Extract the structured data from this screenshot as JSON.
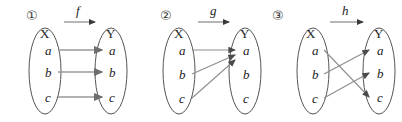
{
  "figure": {
    "background_color": "#ffffff",
    "ink_color": "#2b2b2b",
    "arrow_color": "#8a8a8a",
    "ellipse_color": "#555555",
    "panel_count": 3
  },
  "panels": [
    {
      "index_label": "①",
      "map_label": "f",
      "domain_label": "X",
      "codomain_label": "Y",
      "domain_elements": [
        "a",
        "b",
        "c"
      ],
      "codomain_elements": [
        "a",
        "b",
        "c"
      ],
      "mappings": [
        {
          "from": "a",
          "to": "a"
        },
        {
          "from": "b",
          "to": "b"
        },
        {
          "from": "c",
          "to": "c"
        }
      ]
    },
    {
      "index_label": "②",
      "map_label": "g",
      "domain_label": "X",
      "codomain_label": "Y",
      "domain_elements": [
        "a",
        "b",
        "c"
      ],
      "codomain_elements": [
        "a",
        "b",
        "c"
      ],
      "mappings": [
        {
          "from": "a",
          "to": "a"
        },
        {
          "from": "b",
          "to": "a"
        },
        {
          "from": "c",
          "to": "a"
        }
      ]
    },
    {
      "index_label": "③",
      "map_label": "h",
      "domain_label": "X",
      "codomain_label": "Y",
      "domain_elements": [
        "a",
        "b",
        "c"
      ],
      "codomain_elements": [
        "a",
        "b",
        "c"
      ],
      "mappings": [
        {
          "from": "a",
          "to": "c"
        },
        {
          "from": "b",
          "to": "a"
        },
        {
          "from": "c",
          "to": "b"
        }
      ]
    }
  ]
}
